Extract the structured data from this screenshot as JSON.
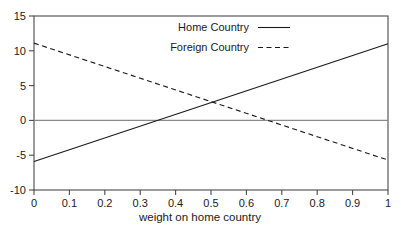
{
  "chart_data": {
    "type": "line",
    "title": "",
    "xlabel": "weight on home country",
    "ylabel": "",
    "xlim": [
      0,
      1
    ],
    "ylim": [
      -10,
      15
    ],
    "grid": false,
    "zero_line": true,
    "legend_position": "top-center",
    "x": [
      0,
      1
    ],
    "xticks": [
      "0",
      "0.1",
      "0.2",
      "0.3",
      "0.4",
      "0.5",
      "0.6",
      "0.7",
      "0.8",
      "0.9",
      "1"
    ],
    "xtick_values": [
      0,
      0.1,
      0.2,
      0.3,
      0.4,
      0.5,
      0.6,
      0.7,
      0.8,
      0.9,
      1
    ],
    "yticks": [
      "15",
      "10",
      "5",
      "0",
      "-5",
      "-10"
    ],
    "ytick_values": [
      15,
      10,
      5,
      0,
      -5,
      -10
    ],
    "series": [
      {
        "name": "Home Country",
        "style": "solid",
        "color": "#1a1a1a",
        "x": [
          0,
          1
        ],
        "values": [
          -5.9,
          11.0
        ]
      },
      {
        "name": "Foreign Country",
        "style": "dashed",
        "color": "#1a1a1a",
        "x": [
          0,
          1
        ],
        "values": [
          11.1,
          -5.7
        ]
      }
    ],
    "crossing_point": {
      "x": 0.5,
      "y": 2.6
    }
  },
  "legend": {
    "entries": [
      {
        "label": "Home Country",
        "style": "solid"
      },
      {
        "label": "Foreign Country",
        "style": "dashed"
      }
    ]
  },
  "colors": {
    "frame": "#4a4a4a",
    "zero_line": "#8a8a8a",
    "line": "#1a1a1a",
    "text": "#1a1a1a",
    "background": "#ffffff"
  }
}
